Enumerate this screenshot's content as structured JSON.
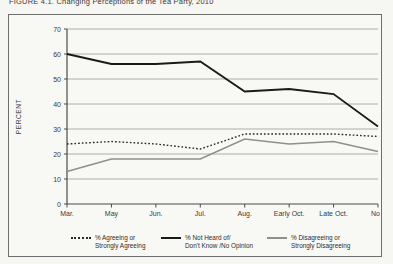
{
  "page": {
    "title": "FIGURE 4.1. Changing Perceptions of the Tea Party, 2010"
  },
  "chart_data": {
    "type": "line",
    "title": "FIGURE 4.1. Changing Perceptions of the Tea Party, 2010",
    "categories": [
      "Mar.",
      "May",
      "Jun.",
      "Jul.",
      "Aug.",
      "Early Oct.",
      "Late Oct.",
      "Nov."
    ],
    "series": [
      {
        "name": "% Agreeing or Strongly Agreeing",
        "legend_lines": [
          "% Agreeing or",
          "Strongly Agreeing"
        ],
        "line_style": "dotted",
        "color": "#2a2a2a",
        "values": [
          24,
          25,
          24,
          22,
          28,
          28,
          28,
          27
        ]
      },
      {
        "name": "% Not Heard of/ Don't Know /No Opinion",
        "legend_lines": [
          "% Not Heard of/",
          "Don't Know /No Opinion"
        ],
        "line_style": "solid",
        "color": "#1a1a1a",
        "values": [
          60,
          56,
          56,
          57,
          45,
          46,
          44,
          31
        ]
      },
      {
        "name": "% Disagreeing or Strongly Disagreeing",
        "legend_lines": [
          "% Disagreeing or",
          "Strongly Disagreeing"
        ],
        "line_style": "solid",
        "color": "#8f8f8f",
        "values": [
          13,
          18,
          18,
          18,
          26,
          24,
          25,
          21
        ]
      }
    ],
    "ylabel": "PERCENT",
    "xlabel": "",
    "ylim": [
      0,
      70
    ],
    "yticks": [
      0,
      10,
      20,
      30,
      40,
      50,
      60,
      70
    ],
    "grid": true,
    "legend_position": "bottom"
  },
  "colors": {
    "page_background": "#f6f6f2",
    "frame_border": "#6e6e6e",
    "grid_line": "#9a9a9a",
    "axis_line": "#4a4a4a",
    "text": "#3a3a3a"
  }
}
